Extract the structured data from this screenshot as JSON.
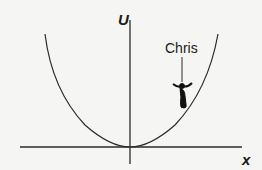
{
  "diagram": {
    "type": "potential-energy-well",
    "y_axis_label": "U",
    "x_axis_label": "x",
    "character_label": "Chris",
    "curve": "parabola",
    "colors": {
      "line": "#2a2a2a",
      "background": "#f5f5f4"
    }
  }
}
